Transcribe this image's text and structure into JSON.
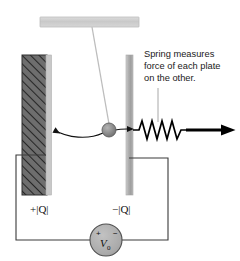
{
  "figure": {
    "title_visible": false,
    "background_color": "#ffffff",
    "annotation": {
      "lines": [
        "Spring measures",
        "force of each plate",
        "on the other."
      ],
      "text_color": "#1a1a1a"
    },
    "labels": {
      "left_plate_charge": "+|Q|",
      "right_plate_charge": "−|Q|",
      "source_plus": "+",
      "source_minus": "−",
      "source_symbol": "V",
      "source_subscript": "0"
    },
    "components": {
      "ceiling_bar": {
        "name": "support-bar",
        "fill": "#cfcfcf",
        "stroke": "#b5b5b5"
      },
      "string": {
        "name": "pendulum-string",
        "stroke": "#b9b9b9"
      },
      "ball": {
        "name": "charged-ball",
        "fill": "#8e8e8e",
        "stroke": "#5a5a5a"
      },
      "left_plate": {
        "name": "positive-plate",
        "fill": "#6e6e6e",
        "hatch_stroke": "#2b2b2b",
        "edge_fill": "#c6c6c6"
      },
      "right_plate": {
        "name": "negative-plate",
        "fill": "#a8a8a8",
        "edge_fill": "#cdcdcd"
      },
      "spring": {
        "name": "spring",
        "stroke": "#000000",
        "coils": 7
      },
      "force_arrow": {
        "name": "force-arrow",
        "stroke": "#000000",
        "direction": "right"
      },
      "attraction_arrows": {
        "name": "attraction-arrows",
        "stroke": "#000000"
      },
      "circuit_wire": {
        "name": "circuit-wire",
        "stroke": "#333333"
      },
      "voltage_source": {
        "name": "voltage-source",
        "fill": "#b0b0b0",
        "stroke": "#4a4a4a"
      },
      "leader_line": {
        "name": "annotation-leader-line",
        "stroke": "#9a9a9a"
      }
    }
  }
}
